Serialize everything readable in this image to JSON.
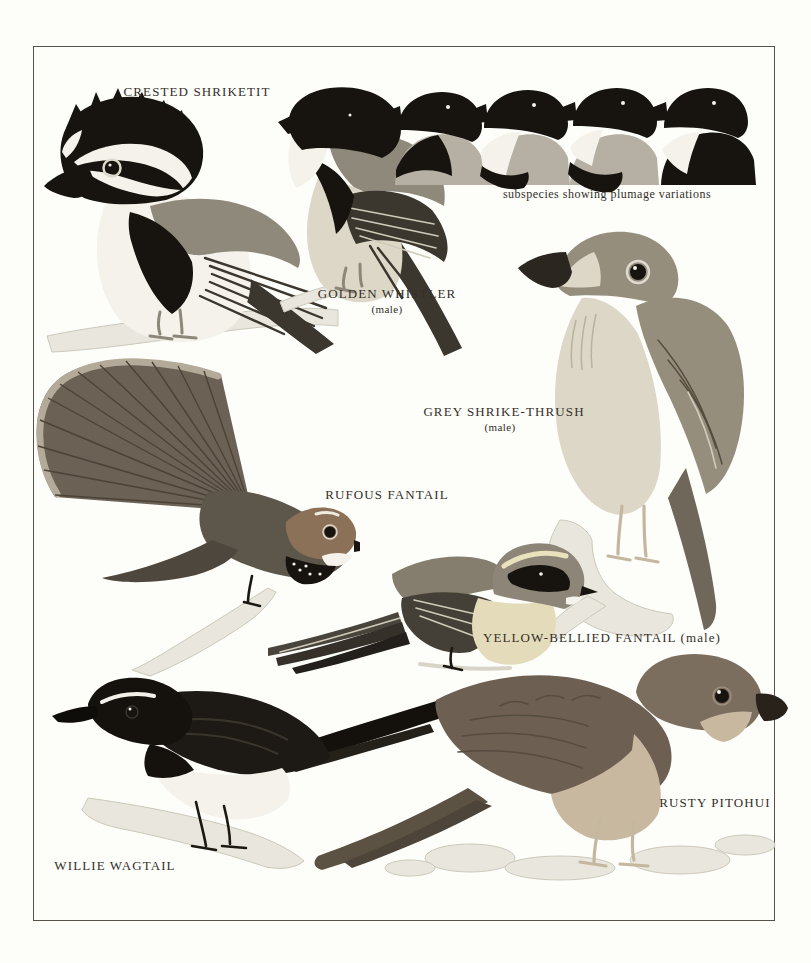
{
  "page": {
    "width": 811,
    "height": 963,
    "kind": "field guide colour plate"
  },
  "labels": {
    "crested_shriketit": "CRESTED SHRIKETIT",
    "golden_whistler": "GOLDEN WHISTLER",
    "golden_whistler_sex": "(male)",
    "subspecies_note": "subspecies showing plumage variations",
    "grey_shrike_thrush": "GREY SHRIKE-THRUSH",
    "grey_shrike_thrush_sex": "(male)",
    "rufous_fantail": "RUFOUS FANTAIL",
    "yellow_bellied_fantail": "YELLOW-BELLIED FANTAIL (male)",
    "willie_wagtail": "WILLIE WAGTAIL",
    "rusty_pitohui": "RUSTY PITOHUI"
  },
  "figures": [
    "crested-shriketit",
    "golden-whistler-male",
    "golden-whistler-subspecies-heads",
    "grey-shrike-thrush-male",
    "rufous-fantail",
    "yellow-bellied-fantail-male",
    "willie-wagtail",
    "rusty-pitohui"
  ],
  "palette": {
    "paper": "#fdfdfa",
    "frame": "#55524a",
    "label": "#332f28",
    "ink": "#17140f",
    "white_plumage": "#f4f2ea",
    "pale_wash": "#e9e7dd",
    "branch_shadow": "#ccc9bb",
    "mid_gray": "#8e897b",
    "dark_wing": "#3b372f",
    "slate": "#6e675a",
    "thrush_gray": "#968e7d",
    "pale_belly": "#dcd7c6",
    "breast_gray": "#b5b0a3",
    "rufous": "#8a7158",
    "warm_brown": "#6d6053",
    "buff": "#c8b8a0"
  }
}
